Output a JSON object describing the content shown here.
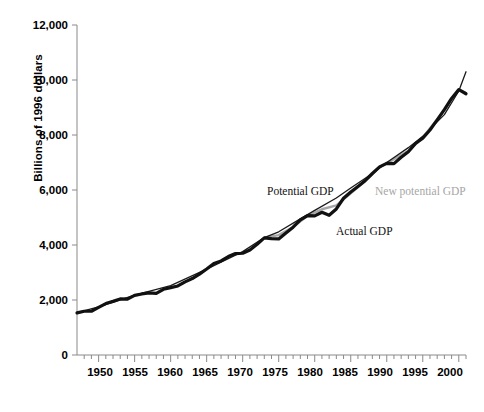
{
  "chart_data": {
    "type": "line",
    "title": "",
    "subtitle": "",
    "xlabel": "",
    "ylabel": "Billions of 1996 dollars",
    "xlim": [
      1947,
      2001
    ],
    "ylim": [
      0,
      12000
    ],
    "grid": false,
    "legend_position": "inline-annotations",
    "y_ticks": [
      "0",
      "2,000",
      "4,000",
      "6,000",
      "8,000",
      "10,000",
      "12,000"
    ],
    "y_tick_values": [
      0,
      2000,
      4000,
      6000,
      8000,
      10000,
      12000
    ],
    "x_ticks": [
      "1950",
      "1955",
      "1960",
      "1965",
      "1970",
      "1975",
      "1980",
      "1985",
      "1990",
      "1995",
      "2000"
    ],
    "x_tick_values": [
      1950,
      1955,
      1960,
      1965,
      1970,
      1975,
      1980,
      1985,
      1990,
      1995,
      2000
    ],
    "x_minor_tick_step": 1,
    "colors": {
      "actual": "#111111",
      "potential": "#1a1a1a",
      "new_potential": "#a6a6a6",
      "axis": "#8a8a8a",
      "background": "#ffffff"
    },
    "series": [
      {
        "name": "Actual GDP",
        "color": "#111111",
        "width": 3.2,
        "x": [
          1947,
          1948,
          1949,
          1950,
          1951,
          1952,
          1953,
          1954,
          1955,
          1956,
          1957,
          1958,
          1959,
          1960,
          1961,
          1962,
          1963,
          1964,
          1965,
          1966,
          1967,
          1968,
          1969,
          1970,
          1971,
          1972,
          1973,
          1974,
          1975,
          1976,
          1977,
          1978,
          1979,
          1980,
          1981,
          1982,
          1983,
          1984,
          1985,
          1986,
          1987,
          1988,
          1989,
          1990,
          1991,
          1992,
          1993,
          1994,
          1995,
          1996,
          1997,
          1998,
          1999,
          2000,
          2001
        ],
        "values": [
          1530,
          1590,
          1590,
          1730,
          1870,
          1950,
          2040,
          2030,
          2170,
          2220,
          2260,
          2240,
          2390,
          2450,
          2510,
          2660,
          2780,
          2940,
          3130,
          3330,
          3420,
          3580,
          3690,
          3700,
          3820,
          4030,
          4260,
          4230,
          4220,
          4440,
          4650,
          4910,
          5070,
          5060,
          5190,
          5080,
          5310,
          5700,
          5930,
          6130,
          6340,
          6600,
          6840,
          6970,
          6960,
          7190,
          7390,
          7690,
          7880,
          8180,
          8550,
          8920,
          9330,
          9650,
          9500
        ]
      },
      {
        "name": "Potential GDP",
        "color": "#1a1a1a",
        "width": 1.3,
        "x": [
          1947,
          1950,
          1955,
          1960,
          1965,
          1970,
          1973,
          1975,
          1978,
          1980,
          1983,
          1985,
          1988,
          1990,
          1993,
          1995,
          1998,
          2000,
          2001
        ],
        "values": [
          1540,
          1750,
          2180,
          2520,
          3120,
          3760,
          4270,
          4480,
          4950,
          5260,
          5710,
          6070,
          6600,
          7000,
          7540,
          7950,
          8740,
          9600,
          10300
        ]
      },
      {
        "name": "New potential GDP",
        "color": "#a6a6a6",
        "width": 2.4,
        "x": [
          1973,
          1975,
          1977,
          1979,
          1981,
          1983,
          1985,
          1987,
          1989,
          1991,
          1993,
          1995,
          1997,
          1999,
          2000,
          2001
        ],
        "values": [
          4270,
          4360,
          4650,
          5060,
          5300,
          5440,
          5880,
          6330,
          6830,
          7120,
          7430,
          7920,
          8560,
          9310,
          9650,
          9520
        ]
      }
    ],
    "annotations": [
      {
        "name": "potential-gdp-label",
        "text": "Potential GDP",
        "x_px": 267,
        "y_px": 185,
        "color": "#111111"
      },
      {
        "name": "new-potential-gdp-label",
        "text": "New potential GDP",
        "x_px": 375,
        "y_px": 185,
        "color": "#a6a6a6"
      },
      {
        "name": "actual-gdp-label",
        "text": "Actual GDP",
        "x_px": 336,
        "y_px": 225,
        "color": "#111111"
      }
    ]
  }
}
